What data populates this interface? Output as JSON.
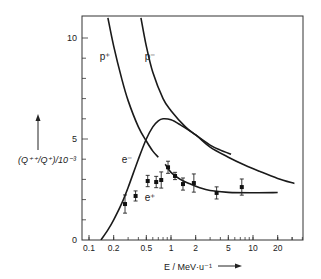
{
  "chart_data": {
    "type": "line",
    "title": "",
    "xlabel": "E / MeV·u⁻¹",
    "ylabel": "(Q⁺⁺/Q⁺)/10⁻³",
    "xscale": "log",
    "xlim": [
      0.085,
      40
    ],
    "ylim": [
      0,
      11
    ],
    "grid": false,
    "legend": "inline labels",
    "x_ticks": [
      {
        "value": 0.1,
        "label": "0.1"
      },
      {
        "value": 0.2,
        "label": "0.2"
      },
      {
        "value": 0.5,
        "label": "0.5"
      },
      {
        "value": 1,
        "label": "1"
      },
      {
        "value": 2,
        "label": "2"
      },
      {
        "value": 5,
        "label": "5"
      },
      {
        "value": 10,
        "label": "10"
      },
      {
        "value": 20,
        "label": "20"
      }
    ],
    "y_ticks": [
      {
        "value": 0,
        "label": "0"
      },
      {
        "value": 5,
        "label": "5"
      },
      {
        "value": 10,
        "label": "10"
      }
    ],
    "series": [
      {
        "name": "p⁺",
        "label": "p⁺",
        "label_pos": [
          0.135,
          8.9
        ],
        "kind": "curve",
        "x": [
          0.17,
          0.2,
          0.25,
          0.3,
          0.4,
          0.5,
          0.6,
          0.7
        ],
        "y": [
          11,
          9.6,
          8.0,
          6.9,
          5.6,
          4.9,
          4.4,
          4.1
        ]
      },
      {
        "name": "p⁻",
        "label": "p⁻",
        "label_pos": [
          0.48,
          8.9
        ],
        "kind": "curve",
        "x": [
          0.43,
          0.5,
          0.6,
          0.8,
          1.0,
          1.5,
          2.0,
          3.0,
          4.0,
          5.4
        ],
        "y": [
          11,
          9.6,
          8.3,
          7.0,
          6.4,
          5.6,
          5.2,
          4.7,
          4.45,
          4.25
        ]
      },
      {
        "name": "e⁻",
        "label": "e⁻",
        "label_pos": [
          0.25,
          3.8
        ],
        "kind": "curve",
        "x": [
          0.14,
          0.17,
          0.2,
          0.25,
          0.3,
          0.4,
          0.5,
          0.6,
          0.7,
          0.8,
          1.0,
          1.3,
          2.0,
          3.0,
          5.0,
          8.0,
          12.0,
          20.0,
          32.0
        ],
        "y": [
          0,
          0.5,
          1.0,
          1.8,
          2.6,
          4.0,
          5.0,
          5.6,
          5.9,
          6.0,
          5.95,
          5.7,
          5.2,
          4.6,
          4.1,
          3.7,
          3.4,
          3.05,
          2.8
        ]
      },
      {
        "name": "e⁺ fit",
        "label": "e⁺",
        "label_pos": [
          0.48,
          1.95
        ],
        "kind": "curve",
        "x": [
          0.85,
          1.0,
          1.3,
          1.7,
          2.2,
          3.0,
          5.0,
          10.0,
          20.0
        ],
        "y": [
          3.75,
          3.35,
          3.0,
          2.78,
          2.6,
          2.45,
          2.36,
          2.34,
          2.35
        ]
      },
      {
        "name": "e⁺ measured",
        "kind": "points_with_error",
        "x": [
          0.275,
          0.37,
          0.52,
          0.66,
          0.76,
          0.92,
          1.12,
          1.4,
          1.9,
          3.6,
          7.3
        ],
        "y": [
          1.78,
          2.18,
          2.92,
          2.87,
          2.97,
          3.6,
          3.17,
          2.77,
          2.82,
          2.33,
          2.62
        ],
        "yerr": [
          0.45,
          0.25,
          0.28,
          0.28,
          0.4,
          0.3,
          0.18,
          0.3,
          0.45,
          0.3,
          0.4
        ]
      }
    ]
  },
  "axes": {
    "x_label_text": "E / MeV·u⁻¹",
    "y_label_text": "(Q⁺⁺/Q⁺)/10⁻³"
  }
}
